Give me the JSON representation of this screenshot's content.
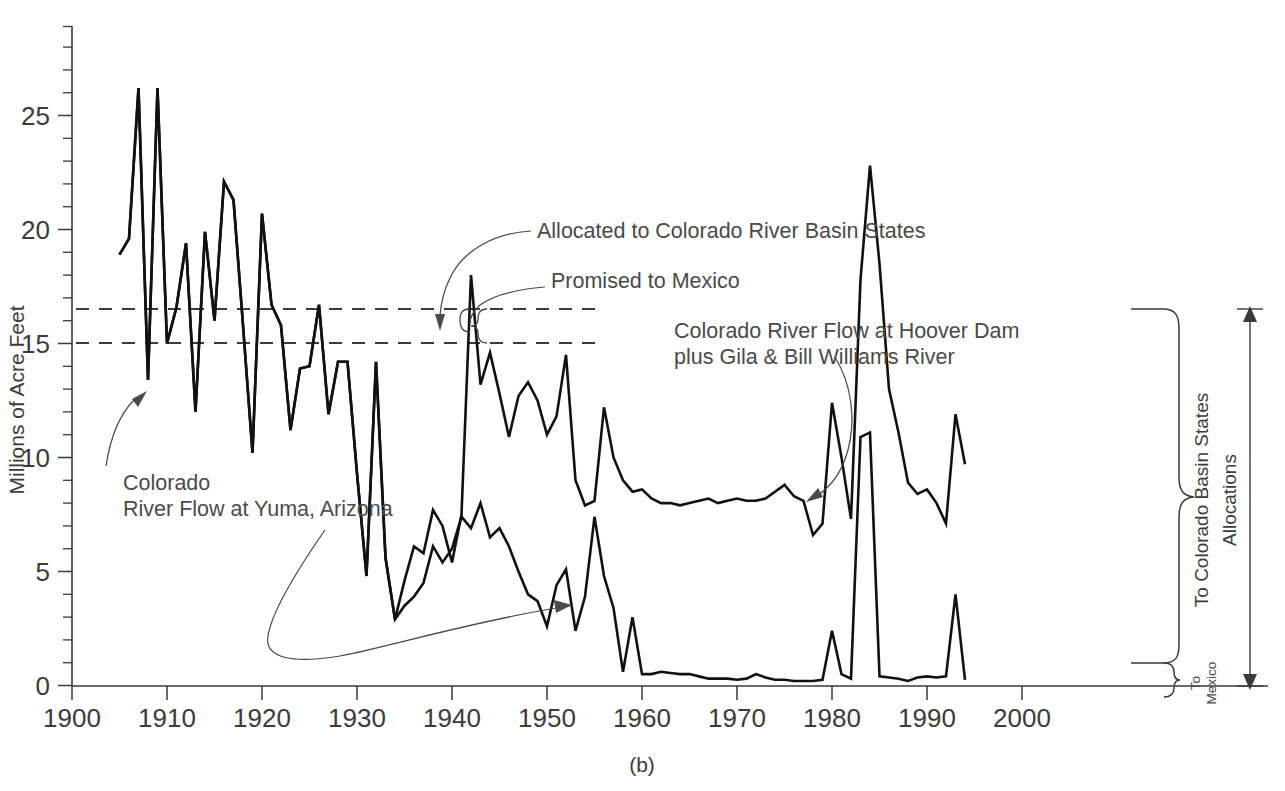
{
  "figure": {
    "caption": "(b)"
  },
  "chart_data": {
    "type": "line",
    "title": "",
    "xlabel": "",
    "ylabel": "Millions of Acre Feet",
    "xlim": [
      1900,
      2005
    ],
    "ylim": [
      0,
      28.5
    ],
    "xticks": [
      1900,
      1910,
      1920,
      1930,
      1940,
      1950,
      1960,
      1970,
      1980,
      1990,
      2000
    ],
    "xtick_labels": [
      "1900",
      "1910",
      "1920",
      "1930",
      "1940",
      "1950",
      "1960",
      "1970",
      "1980",
      "1990",
      "2000"
    ],
    "yticks": [
      0,
      5,
      10,
      15,
      20,
      25
    ],
    "ytick_labels": [
      "0",
      "5",
      "10",
      "15",
      "20",
      "25"
    ],
    "ytick_minor_step": 1,
    "grid": false,
    "legend_position": "inline-annotations",
    "reference_lines": [
      {
        "name": "allocated-to-basin-states",
        "y": 16.5,
        "style": "dashed",
        "x_start": 1900,
        "x_end": 1956
      },
      {
        "name": "promised-to-mexico",
        "y": 15.0,
        "style": "dashed",
        "x_start": 1900,
        "x_end": 1956
      }
    ],
    "series": [
      {
        "name": "Colorado River Flow at Yuma, Arizona",
        "x": [
          1905,
          1906,
          1907,
          1908,
          1909,
          1910,
          1911,
          1912,
          1913,
          1914,
          1915,
          1916,
          1917,
          1918,
          1919,
          1920,
          1921,
          1922,
          1923,
          1924,
          1925,
          1926,
          1927,
          1928,
          1929,
          1930,
          1931,
          1932,
          1933,
          1934,
          1935,
          1936,
          1937,
          1938,
          1939,
          1940,
          1941,
          1942,
          1943,
          1944,
          1945,
          1946,
          1947,
          1948,
          1949,
          1950,
          1951,
          1952,
          1953,
          1954,
          1955,
          1956,
          1957,
          1958,
          1959,
          1960,
          1961,
          1962,
          1963,
          1964,
          1965,
          1966,
          1967,
          1968,
          1969,
          1970,
          1971,
          1972,
          1973,
          1974,
          1975,
          1976,
          1977,
          1978,
          1979,
          1980,
          1981,
          1982,
          1983,
          1984,
          1985,
          1986,
          1987,
          1988,
          1989,
          1990,
          1991,
          1992,
          1993,
          1994
        ],
        "values": [
          18.9,
          19.6,
          26.2,
          13.4,
          26.2,
          15.0,
          16.6,
          19.4,
          12.0,
          19.9,
          16.0,
          22.1,
          21.3,
          15.8,
          10.2,
          20.7,
          16.7,
          15.8,
          11.2,
          13.9,
          14.0,
          16.7,
          11.9,
          14.2,
          14.2,
          9.3,
          4.8,
          14.2,
          5.6,
          2.9,
          3.5,
          3.9,
          4.5,
          6.1,
          5.4,
          6.0,
          7.4,
          6.9,
          8.0,
          6.5,
          6.9,
          6.1,
          5.0,
          4.0,
          3.7,
          2.6,
          4.4,
          5.1,
          2.4,
          3.9,
          7.4,
          4.8,
          3.4,
          0.6,
          3.0,
          0.5,
          0.5,
          0.6,
          0.55,
          0.5,
          0.5,
          0.4,
          0.3,
          0.3,
          0.3,
          0.25,
          0.3,
          0.5,
          0.35,
          0.25,
          0.25,
          0.2,
          0.2,
          0.2,
          0.25,
          2.4,
          0.5,
          0.3,
          10.9,
          11.1,
          0.4,
          0.35,
          0.3,
          0.2,
          0.35,
          0.4,
          0.35,
          0.4,
          4.0,
          0.25
        ],
        "line_style": "solid",
        "color": "#111111",
        "note": "Lower curve after 1934; identical to upper curve before 1934"
      },
      {
        "name": "Colorado River Flow at Hoover Dam plus Gila & Bill Williams River",
        "x": [
          1905,
          1906,
          1907,
          1908,
          1909,
          1910,
          1911,
          1912,
          1913,
          1914,
          1915,
          1916,
          1917,
          1918,
          1919,
          1920,
          1921,
          1922,
          1923,
          1924,
          1925,
          1926,
          1927,
          1928,
          1929,
          1930,
          1931,
          1932,
          1933,
          1934,
          1935,
          1936,
          1937,
          1938,
          1939,
          1940,
          1941,
          1942,
          1943,
          1944,
          1945,
          1946,
          1947,
          1948,
          1949,
          1950,
          1951,
          1952,
          1953,
          1954,
          1955,
          1956,
          1957,
          1958,
          1959,
          1960,
          1961,
          1962,
          1963,
          1964,
          1965,
          1966,
          1967,
          1968,
          1969,
          1970,
          1971,
          1972,
          1973,
          1974,
          1975,
          1976,
          1977,
          1978,
          1979,
          1980,
          1981,
          1982,
          1983,
          1984,
          1985,
          1986,
          1987,
          1988,
          1989,
          1990,
          1991,
          1992,
          1993,
          1994
        ],
        "values": [
          18.9,
          19.6,
          26.2,
          13.4,
          26.2,
          15.0,
          16.6,
          19.4,
          12.0,
          19.9,
          16.0,
          22.1,
          21.3,
          15.8,
          10.2,
          20.7,
          16.7,
          15.8,
          11.2,
          13.9,
          14.0,
          16.7,
          11.9,
          14.2,
          14.2,
          9.3,
          4.8,
          14.2,
          5.6,
          2.9,
          4.6,
          6.1,
          5.8,
          7.7,
          7.0,
          5.4,
          7.5,
          18.0,
          13.2,
          14.6,
          12.8,
          10.9,
          12.7,
          13.3,
          12.5,
          11.0,
          11.8,
          14.5,
          9.0,
          7.9,
          8.1,
          12.2,
          10.0,
          9.0,
          8.5,
          8.6,
          8.2,
          8.0,
          8.0,
          7.9,
          8.0,
          8.1,
          8.2,
          8.0,
          8.1,
          8.2,
          8.1,
          8.1,
          8.2,
          8.5,
          8.8,
          8.3,
          8.1,
          6.6,
          7.1,
          12.4,
          10.0,
          7.3,
          17.8,
          22.8,
          18.5,
          13.0,
          11.1,
          8.9,
          8.4,
          8.6,
          8.0,
          7.1,
          11.9,
          9.7
        ],
        "line_style": "solid",
        "color": "#111111",
        "note": "Upper curve after 1934; identical to lower curve before 1934"
      }
    ],
    "annotations": [
      {
        "name": "allocated-to-basin-states-label",
        "text": "Allocated to Colorado River Basin States",
        "points_to_y": 16.5
      },
      {
        "name": "promised-to-mexico-label",
        "text": "Promised to Mexico",
        "points_to_y": 15.0
      },
      {
        "name": "hoover-dam-series-label",
        "text": "Colorado River Flow at Hoover Dam",
        "text2": "plus Gila & Bill Williams River"
      },
      {
        "name": "yuma-series-label",
        "text": "Colorado",
        "text2": "River Flow at Yuma, Arizona"
      }
    ],
    "right_brackets": [
      {
        "name": "to-colorado-basin-states-bracket",
        "label": "To Colorado Basin States",
        "y_from": 1.5,
        "y_to": 16.5
      },
      {
        "name": "to-mexico-bracket",
        "label_line1": "To",
        "label_line2": "Mexico",
        "y_from": 0,
        "y_to": 1.5
      },
      {
        "name": "allocations-arrow",
        "label": "Allocations",
        "y_from": 0,
        "y_to": 16.5
      }
    ]
  }
}
